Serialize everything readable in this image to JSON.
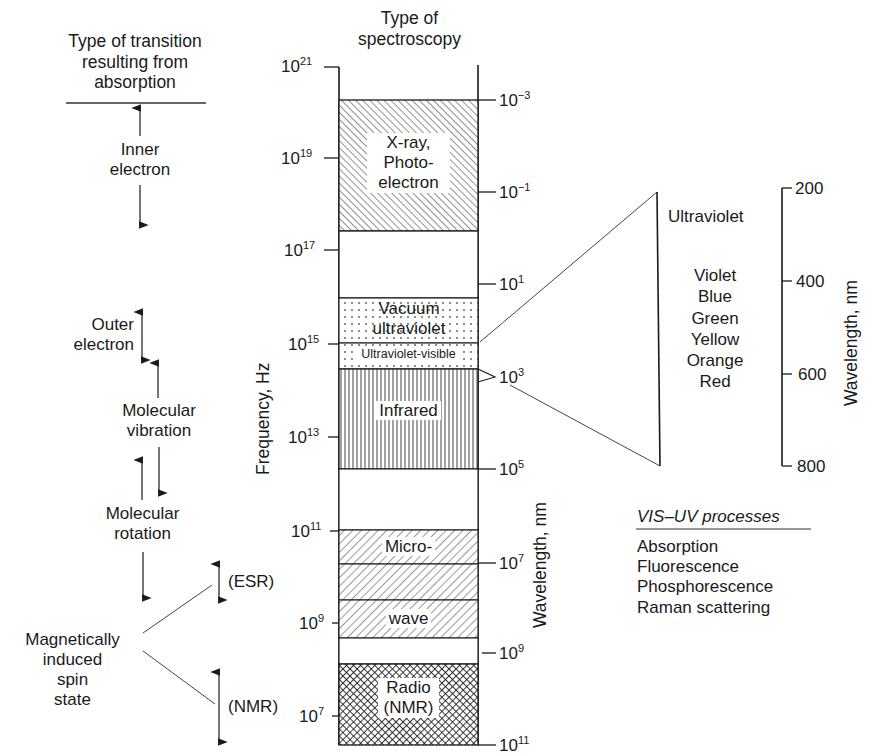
{
  "left_column": {
    "title": [
      "Type of transition",
      "resulting from",
      "absorption"
    ],
    "transitions": [
      {
        "label": [
          "Inner",
          "electron"
        ]
      },
      {
        "label": [
          "Outer",
          "electron"
        ]
      },
      {
        "label": [
          "Molecular",
          "vibration"
        ]
      },
      {
        "label": [
          "Molecular",
          "rotation"
        ]
      },
      {
        "label": [
          "Magnetically",
          "induced",
          "spin",
          "state"
        ]
      }
    ],
    "spin_branches": [
      "(ESR)",
      "(NMR)"
    ]
  },
  "center_column": {
    "title": [
      "Type of",
      "spectroscopy"
    ],
    "frequency_axis_label": "Frequency, Hz",
    "wavelength_axis_label": "Wavelength, nm",
    "frequency_ticks": [
      {
        "base": "10",
        "exp": "21"
      },
      {
        "base": "10",
        "exp": "19"
      },
      {
        "base": "10",
        "exp": "17"
      },
      {
        "base": "10",
        "exp": "15"
      },
      {
        "base": "10",
        "exp": "13"
      },
      {
        "base": "10",
        "exp": "11"
      },
      {
        "base": "10",
        "exp": "9"
      },
      {
        "base": "10",
        "exp": "7"
      }
    ],
    "wavelength_ticks": [
      {
        "base": "10",
        "exp": "−3"
      },
      {
        "base": "10",
        "exp": "−1"
      },
      {
        "base": "10",
        "exp": "1"
      },
      {
        "base": "10",
        "exp": "3"
      },
      {
        "base": "10",
        "exp": "5"
      },
      {
        "base": "10",
        "exp": "7"
      },
      {
        "base": "10",
        "exp": "9"
      },
      {
        "base": "10",
        "exp": "11"
      }
    ],
    "regions": [
      {
        "label": [
          "X-ray,",
          "Photo-",
          "electron"
        ],
        "pattern": "diagonal-hatch-dense"
      },
      {
        "label": [
          "Vacuum",
          "ultraviolet"
        ],
        "pattern": "dots"
      },
      {
        "label": [
          "Ultraviolet-visible"
        ],
        "pattern": "dots"
      },
      {
        "label": [
          "Infrared"
        ],
        "pattern": "vertical-lines"
      },
      {
        "label": [
          "Micro-"
        ],
        "pattern": "diagonal-hatch"
      },
      {
        "label": [
          "wave"
        ],
        "pattern": "diagonal-hatch"
      },
      {
        "label": [
          "Radio",
          "(NMR)"
        ],
        "pattern": "crosshatch"
      }
    ]
  },
  "right_column": {
    "expanded_labels": [
      "Ultraviolet",
      "Violet",
      "Blue",
      "Green",
      "Yellow",
      "Orange",
      "Red"
    ],
    "nm_scale_label": "Wavelength, nm",
    "nm_ticks": [
      "200",
      "400",
      "600",
      "800"
    ],
    "processes_title": "VIS–UV processes",
    "processes": [
      "Absorption",
      "Fluorescence",
      "Phosphorescence",
      "Raman scattering"
    ]
  }
}
